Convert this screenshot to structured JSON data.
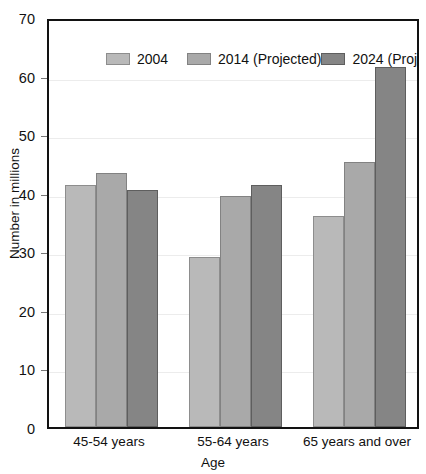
{
  "chart_data": {
    "type": "bar",
    "title": "",
    "xlabel": "Age",
    "ylabel": "Number in millions",
    "categories": [
      "45-54 years",
      "55-64 years",
      "65 years and over"
    ],
    "series": [
      {
        "name": "2004",
        "color": "#b9b9b9",
        "values": [
          41.3,
          29.0,
          36.0
        ]
      },
      {
        "name": "2014 (Projected)",
        "color": "#a9a9a9",
        "values": [
          43.4,
          39.5,
          45.2
        ]
      },
      {
        "name": "2024 (Projected)",
        "color": "#858585",
        "values": [
          40.5,
          41.4,
          61.5
        ]
      }
    ],
    "ylim": [
      0,
      70
    ],
    "yticks": [
      0,
      10,
      20,
      30,
      40,
      50,
      60,
      70
    ],
    "ytick_labels": [
      "0",
      "10",
      "20",
      "30",
      "40",
      "50",
      "60",
      "70"
    ],
    "grid": true,
    "legend_position": "top-inside"
  }
}
